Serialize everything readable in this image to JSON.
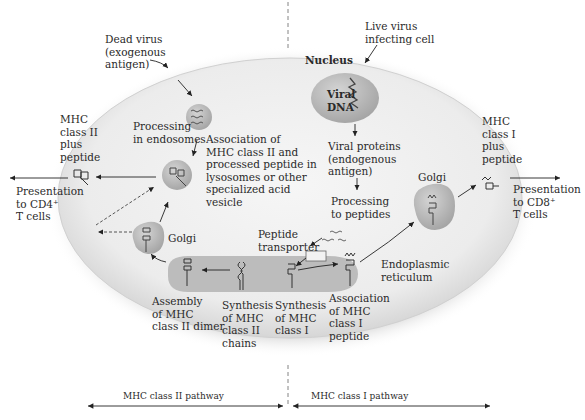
{
  "diagram": {
    "labels": {
      "dead_virus": "Dead virus\n(exogenous\nantigen)",
      "live_virus": "Live virus\ninfecting cell",
      "nucleus": "Nucleus",
      "viral_dna": "Viral\nDNA",
      "processing_endosomes": "Processing\nin endosomes",
      "association_class2": "Association of\nMHC class II and\nprocessed peptide in\nlysosomes or other\nspecialized acid\nvesicle",
      "mhc2_plus_peptide": "MHC\nclass II\nplus\npeptide",
      "presentation_cd4": "Presentation\nto CD4⁺\nT cells",
      "viral_proteins": "Viral proteins\n(endogenous\nantigen)",
      "processing_peptides": "Processing\nto peptides",
      "mhc1_plus_peptide": "MHC\nclass I\nplus\npeptide",
      "presentation_cd8": "Presentation\nto CD8⁺\nT cells",
      "golgi_left": "Golgi",
      "golgi_right": "Golgi",
      "peptide_transporter": "Peptide\ntransporter",
      "endoplasmic_reticulum": "Endoplasmic\nreticulum",
      "assembly_class2": "Assembly\nof MHC\nclass II dimer",
      "synthesis_class2": "Synthesis\nof MHC\nclass II\nchains",
      "synthesis_class1": "Synthesis\nof MHC\nclass I",
      "association_class1": "Association\nof MHC\nclass I\npeptide"
    },
    "pathways": {
      "left": "MHC class II pathway",
      "right": "MHC class I pathway"
    },
    "colors": {
      "cell": "#ededed",
      "organelle": "#b8b8b8",
      "er": "#bdbdbd",
      "background": "#ffffff"
    }
  }
}
